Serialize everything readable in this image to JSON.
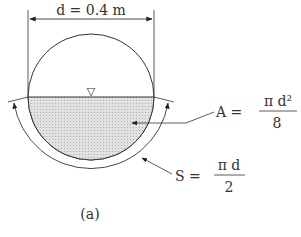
{
  "diagram": {
    "diameter_label": "d = 0.4 m",
    "area_label": {
      "lhs": "A =",
      "numerator": "π d²",
      "denominator": "8"
    },
    "perimeter_label": {
      "lhs": "S =",
      "numerator": "π d",
      "denominator": "2"
    },
    "caption": "(a)",
    "water_surface_symbol": "▽",
    "colors": {
      "line": "#333333",
      "fill": "#d0d0d0"
    }
  }
}
